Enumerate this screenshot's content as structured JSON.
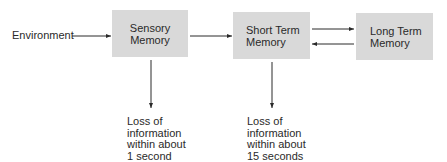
{
  "diagram": {
    "title": "",
    "input_label": "Environment",
    "nodes": [
      {
        "id": "sensory",
        "lines": [
          "Sensory",
          "Memory"
        ]
      },
      {
        "id": "short_term",
        "lines": [
          "Short Term",
          "Memory"
        ]
      },
      {
        "id": "long_term",
        "lines": [
          "Long Term",
          "Memory"
        ]
      }
    ],
    "edges": [
      {
        "from": "environment",
        "to": "sensory"
      },
      {
        "from": "sensory",
        "to": "short_term"
      },
      {
        "from": "short_term",
        "to": "long_term"
      },
      {
        "from": "long_term",
        "to": "short_term"
      },
      {
        "from": "sensory",
        "to": "loss_sensory"
      },
      {
        "from": "short_term",
        "to": "loss_short_term"
      }
    ],
    "outcomes": [
      {
        "id": "loss_sensory",
        "lines": [
          "Loss of",
          "information",
          "within about",
          "1 second"
        ]
      },
      {
        "id": "loss_short_term",
        "lines": [
          "Loss of",
          "information",
          "within about",
          "15 seconds"
        ]
      }
    ],
    "colors": {
      "box_fill": "#d9d9d9",
      "line": "#2a2a2a",
      "text": "#2a2a2a"
    }
  }
}
